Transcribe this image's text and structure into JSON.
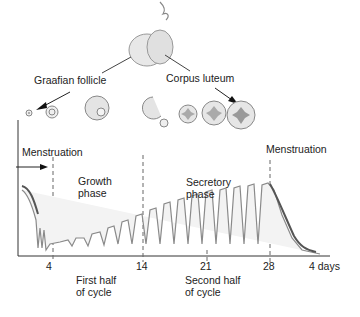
{
  "diagram": {
    "type": "menstrual-cycle-endometrium",
    "organ": "ovary",
    "labels": {
      "graafian_follicle": "Graafian follicle",
      "corpus_luteum": "Corpus luteum",
      "menstruation_left": "Menstruation",
      "menstruation_right": "Menstruation",
      "growth_phase_1": "Growth",
      "growth_phase_2": "phase",
      "secretory_phase_1": "Secretory",
      "secretory_phase_2": "phase",
      "first_half_1": "First half",
      "first_half_2": "of cycle",
      "second_half_1": "Second half",
      "second_half_2": "of cycle"
    },
    "x_axis": {
      "ticks": [
        "4",
        "14",
        "21",
        "28",
        "4 days"
      ]
    },
    "colors": {
      "line": "#333333",
      "tissue": "#999999",
      "dash": "#666666"
    }
  }
}
